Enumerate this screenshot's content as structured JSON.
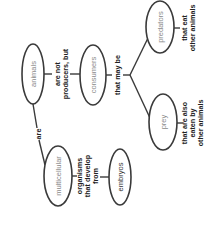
{
  "diagram": {
    "type": "concept-map",
    "orientation": "rotated-90-clockwise",
    "nodes": {
      "animals": "animals",
      "consumers": "consumers",
      "predators": "predators",
      "prey": "prey",
      "multicellular": "multicellular",
      "embryos": "embryos"
    },
    "links": {
      "animals_consumers": [
        "are not",
        "producers, but"
      ],
      "consumers_branch": "that may be",
      "predators_desc": [
        "that eat",
        "other animals"
      ],
      "prey_desc": [
        "that are also",
        "eaten by",
        "other animals"
      ],
      "animals_multicellular": "are",
      "multicellular_embryos": [
        "organisms",
        "that develop",
        "from"
      ]
    },
    "colors": {
      "outline": "#3a3a3a",
      "node_text": "#8a8a8a",
      "link_text": "#222222"
    }
  }
}
